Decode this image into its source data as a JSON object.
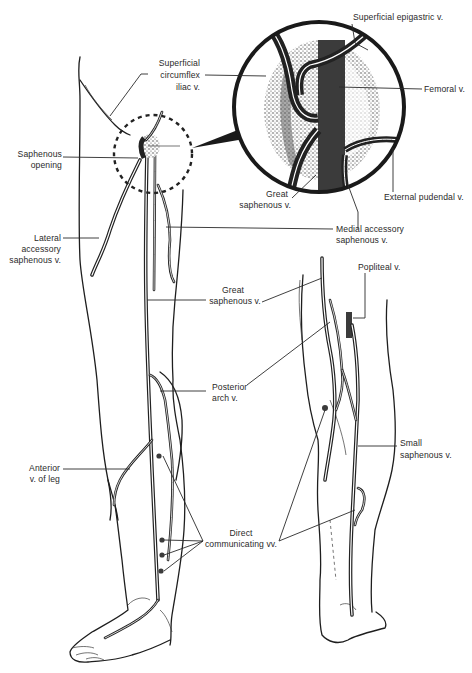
{
  "figure": {
    "inset": {
      "description": "Magnified view of saphenous opening",
      "labels": {
        "superficial_epigastric": "Superficial epigastric v.",
        "femoral": "Femoral v.",
        "external_pudendal": "External pudendal v.",
        "great_saphenous_inset_line1": "Great",
        "great_saphenous_inset_line2": "saphenous v."
      }
    },
    "anterior_view": {
      "labels": {
        "superficial_circumflex_iliac_line1": "Superficial",
        "superficial_circumflex_iliac_line2": "circumflex",
        "superficial_circumflex_iliac_line3": "iliac v.",
        "saphenous_opening_line1": "Saphenous",
        "saphenous_opening_line2": "opening",
        "lateral_accessory_line1": "Lateral",
        "lateral_accessory_line2": "accessory",
        "lateral_accessory_line3": "saphenous v.",
        "medial_accessory_line1": "Medial accessory",
        "medial_accessory_line2": "saphenous v.",
        "great_saphenous_line1": "Great",
        "great_saphenous_line2": "saphenous v.",
        "posterior_arch_line1": "Posterior",
        "posterior_arch_line2": "arch v.",
        "anterior_v_of_leg_line1": "Anterior",
        "anterior_v_of_leg_line2": "v. of leg",
        "direct_communicating_line1": "Direct",
        "direct_communicating_line2": "communicating vv."
      }
    },
    "posterior_view": {
      "labels": {
        "popliteal": "Popliteal v.",
        "small_saphenous_line1": "Small",
        "small_saphenous_line2": "saphenous v."
      }
    },
    "colors": {
      "line": "#1e1e1e",
      "vein_fill": "#3b3b3b",
      "text": "#2a2a2a",
      "background": "#ffffff"
    }
  }
}
